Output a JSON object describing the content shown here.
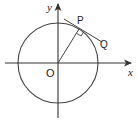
{
  "diagram": {
    "type": "circle-tangent",
    "labels": {
      "x_axis": "x",
      "y_axis": "y",
      "origin": "O",
      "point_p": "P",
      "point_q": "Q"
    },
    "geometry": {
      "origin": [
        58,
        63
      ],
      "radius": 40,
      "point_p": [
        79,
        29
      ],
      "tangent_start": [
        64,
        19
      ],
      "tangent_end": [
        102,
        42
      ]
    },
    "colors": {
      "stroke": "#333333",
      "background": "#ffffff"
    }
  }
}
